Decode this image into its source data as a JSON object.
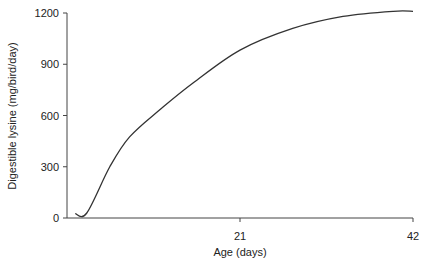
{
  "chart_data": {
    "type": "line",
    "title": "",
    "xlabel": "Age (days)",
    "ylabel": "Digestible lysine (mg/bird/day)",
    "xlim": [
      0,
      42
    ],
    "ylim": [
      0,
      1200
    ],
    "x_ticks": [
      21,
      42
    ],
    "x_tick_labels": [
      "21",
      "42"
    ],
    "y_ticks": [
      0,
      300,
      600,
      900,
      1200
    ],
    "y_tick_labels": [
      "0",
      "300",
      "600",
      "900",
      "1200"
    ],
    "grid": false,
    "legend": null,
    "series": [
      {
        "name": "Digestible lysine requirement",
        "color": "#333333",
        "x": [
          1,
          2.4,
          5.2,
          7.6,
          11.3,
          15.3,
          21,
          27.4,
          33.5,
          39.6,
          42
        ],
        "values": [
          25,
          29,
          300,
          475,
          635,
          790,
          983,
          1110,
          1180,
          1210,
          1210
        ]
      }
    ]
  }
}
